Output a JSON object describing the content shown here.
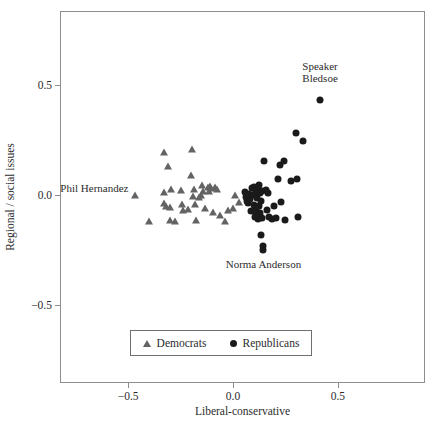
{
  "chart_data": {
    "type": "scatter",
    "title": "",
    "xlabel": "Liberal-conservative",
    "ylabel": "Regional / social issues",
    "xlim": [
      -0.82,
      0.92
    ],
    "ylim": [
      -0.86,
      0.83
    ],
    "xticks": [
      -0.5,
      0.0,
      0.5
    ],
    "xticklabels": [
      "−0.5",
      "0.0",
      "0.5"
    ],
    "yticks": [
      0.5,
      0.0,
      -0.5
    ],
    "yticklabels": [
      "0.5",
      "0.0",
      "−0.5"
    ],
    "grid": false,
    "legend_position": "lower-center-inside",
    "series": [
      {
        "name": "Democrats",
        "marker": "triangle",
        "color": "#636363",
        "points": [
          [
            -0.465,
            0.0
          ],
          [
            -0.4,
            -0.118
          ],
          [
            -0.33,
            0.195
          ],
          [
            -0.33,
            0.011
          ],
          [
            -0.328,
            -0.036
          ],
          [
            -0.32,
            -0.05
          ],
          [
            -0.31,
            0.13
          ],
          [
            -0.3,
            -0.054
          ],
          [
            -0.3,
            -0.114
          ],
          [
            -0.295,
            0.025
          ],
          [
            -0.275,
            -0.118
          ],
          [
            -0.25,
            0.023
          ],
          [
            -0.245,
            -0.041
          ],
          [
            -0.24,
            -0.068
          ],
          [
            -0.215,
            -0.064
          ],
          [
            -0.2,
            0.091
          ],
          [
            -0.195,
            0.209
          ],
          [
            -0.19,
            -0.005
          ],
          [
            -0.185,
            0.027
          ],
          [
            -0.18,
            -0.041
          ],
          [
            -0.175,
            -0.114
          ],
          [
            -0.16,
            -0.009
          ],
          [
            -0.155,
            0.0
          ],
          [
            -0.15,
            0.046
          ],
          [
            -0.145,
            0.018
          ],
          [
            -0.135,
            -0.059
          ],
          [
            -0.12,
            0.034
          ],
          [
            -0.115,
            0.018
          ],
          [
            -0.11,
            0.041
          ],
          [
            -0.105,
            0.032
          ],
          [
            -0.095,
            -0.077
          ],
          [
            -0.085,
            0.036
          ],
          [
            -0.075,
            0.027
          ],
          [
            -0.06,
            -0.091
          ],
          [
            -0.04,
            -0.118
          ],
          [
            -0.025,
            -0.068
          ],
          [
            0.0,
            -0.059
          ],
          [
            0.01,
            0.0
          ],
          [
            0.03,
            -0.032
          ]
        ]
      },
      {
        "name": "Republicans",
        "marker": "circle",
        "color": "#1a1a1a",
        "points": [
          [
            0.055,
            0.014
          ],
          [
            0.06,
            -0.009
          ],
          [
            0.065,
            -0.027
          ],
          [
            0.07,
            -0.036
          ],
          [
            0.075,
            0.005
          ],
          [
            0.08,
            -0.018
          ],
          [
            0.085,
            -0.073
          ],
          [
            0.09,
            0.032
          ],
          [
            0.095,
            0.0
          ],
          [
            0.098,
            -0.045
          ],
          [
            0.1,
            0.036
          ],
          [
            0.103,
            -0.1
          ],
          [
            0.105,
            0.005
          ],
          [
            0.108,
            -0.064
          ],
          [
            0.11,
            -0.091
          ],
          [
            0.112,
            -0.014
          ],
          [
            0.115,
            0.014
          ],
          [
            0.118,
            -0.109
          ],
          [
            0.12,
            0.027
          ],
          [
            0.122,
            -0.05
          ],
          [
            0.125,
            0.045
          ],
          [
            0.128,
            -0.082
          ],
          [
            0.13,
            0.009
          ],
          [
            0.132,
            -0.027
          ],
          [
            0.135,
            -0.182
          ],
          [
            0.138,
            -0.105
          ],
          [
            0.14,
            0.018
          ],
          [
            0.142,
            -0.232
          ],
          [
            0.145,
            -0.25
          ],
          [
            0.15,
            0.155
          ],
          [
            0.155,
            0.023
          ],
          [
            0.16,
            -0.068
          ],
          [
            0.165,
            0.009
          ],
          [
            0.17,
            -0.1
          ],
          [
            0.185,
            -0.109
          ],
          [
            0.195,
            -0.05
          ],
          [
            0.205,
            -0.105
          ],
          [
            0.215,
            0.073
          ],
          [
            0.225,
            0.136
          ],
          [
            0.23,
            -0.032
          ],
          [
            0.245,
            0.155
          ],
          [
            0.25,
            -0.114
          ],
          [
            0.275,
            0.064
          ],
          [
            0.3,
            0.282
          ],
          [
            0.305,
            0.073
          ],
          [
            0.31,
            -0.1
          ],
          [
            0.335,
            0.245
          ],
          [
            0.415,
            0.432
          ]
        ]
      }
    ],
    "annotations": [
      {
        "id": "speaker-bledsoe",
        "lines": [
          "Speaker",
          "Bledsoe"
        ],
        "text": "Speaker Bledsoe",
        "x": 0.415,
        "y": 0.432,
        "align": "center",
        "dx": 0,
        "dy": -40
      },
      {
        "id": "phil-hernandez",
        "lines": [
          "Phil Hernandez"
        ],
        "text": "Phil Hernandez",
        "x": -0.465,
        "y": 0.0,
        "align": "right",
        "dx": -7,
        "dy": -13
      },
      {
        "id": "norma-anderson",
        "lines": [
          "Norma Anderson"
        ],
        "text": "Norma Anderson",
        "x": 0.145,
        "y": -0.25,
        "align": "center",
        "dx": 0,
        "dy": 8
      }
    ]
  },
  "legend": {
    "entries": [
      {
        "label": "Democrats",
        "marker": "triangle-up-icon"
      },
      {
        "label": "Republicans",
        "marker": "circle-icon"
      }
    ]
  }
}
